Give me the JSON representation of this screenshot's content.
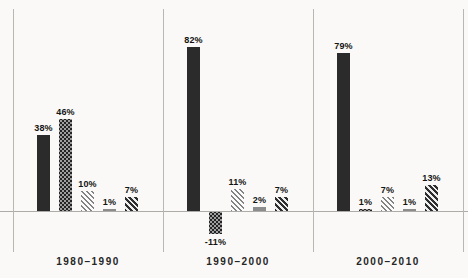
{
  "chart_data": {
    "type": "bar",
    "unit": "%",
    "title": "",
    "xlabel": "",
    "ylabel": "",
    "ylim": [
      -15,
      90
    ],
    "grid": false,
    "legend": "none",
    "baseline_value": 0,
    "categories": [
      "1980–1990",
      "1990–2000",
      "2000–2010"
    ],
    "groups": [
      {
        "label": "1980–1990",
        "values": [
          38,
          46,
          10,
          1,
          7
        ],
        "value_labels": [
          "38%",
          "46%",
          "10%",
          "1%",
          "7%"
        ]
      },
      {
        "label": "1990–2000",
        "values": [
          82,
          -11,
          11,
          2,
          7
        ],
        "value_labels": [
          "82%",
          "-11%",
          "11%",
          "2%",
          "7%"
        ]
      },
      {
        "label": "2000–2010",
        "values": [
          79,
          1,
          7,
          1,
          13
        ],
        "value_labels": [
          "79%",
          "1%",
          "7%",
          "1%",
          "13%"
        ]
      }
    ],
    "series_styles": [
      "solid-dark",
      "checker-dark",
      "hatch-light",
      "solid-gray",
      "hatch-dark"
    ],
    "colors": {
      "bar_dark": "#2b2b2b",
      "bar_gray": "#8c8c8c",
      "hatch_line": "#838383",
      "axis_line": "#aeaca9",
      "background": "#faf9f7",
      "text": "#141414"
    }
  }
}
